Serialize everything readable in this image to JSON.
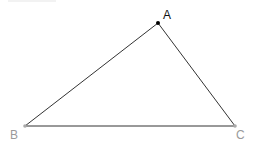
{
  "diagram": {
    "type": "triangle",
    "points": {
      "A": {
        "label": "A",
        "x": 158,
        "y": 23,
        "color": "#000000",
        "label_color": "#111111"
      },
      "B": {
        "label": "B",
        "x": 25,
        "y": 126,
        "color": "#aaaaaa",
        "label_color": "#9a9a9a"
      },
      "C": {
        "label": "C",
        "x": 235,
        "y": 126,
        "color": "#aaaaaa",
        "label_color": "#9a9a9a"
      }
    },
    "edge_color": "#333333",
    "edges": [
      "AB",
      "AC",
      "BC"
    ]
  }
}
